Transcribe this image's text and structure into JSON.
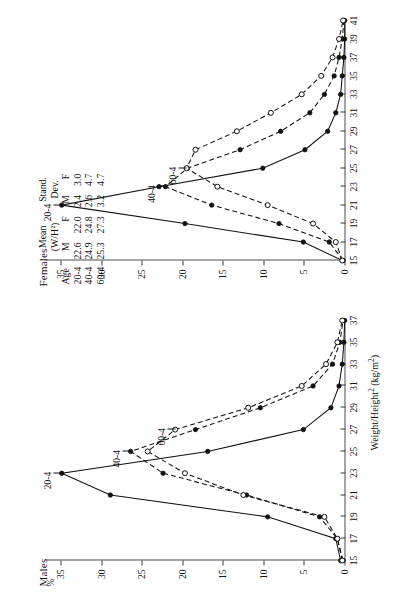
{
  "figure": {
    "panels": [
      {
        "id": "males",
        "title": "Males"
      },
      {
        "id": "females",
        "title": "Females"
      }
    ],
    "y_axis_unit": "%",
    "x_axis_title_html": "Weight/Height<sup>2</sup> (kg/m<sup>2</sup>)",
    "x_axis_title": "Weight/Height2 (kg/m2)"
  },
  "stats_table": {
    "group_headers": [
      "Mean (W/H²)",
      "Stand. Dev."
    ],
    "mean_header_line1": "Mean",
    "mean_header_line2": "(W/H²)",
    "sd_header_line1": "Stand.",
    "sd_header_line2": "Dev.",
    "columns": [
      "Age",
      "M",
      "F",
      "M",
      "F"
    ],
    "rows": [
      {
        "age": "20-4",
        "mean_m": "22.6",
        "mean_f": "22.0",
        "sd_m": "2.4",
        "sd_f": "3.0"
      },
      {
        "age": "40-4",
        "mean_m": "24.9",
        "mean_f": "24.8",
        "sd_m": "2.6",
        "sd_f": "4.7"
      },
      {
        "age": "60-4",
        "mean_m": "25.3",
        "mean_f": "27.3",
        "sd_m": "3.2",
        "sd_f": "4.7"
      }
    ]
  },
  "chart_data": {
    "type": "line",
    "title": "",
    "xlabel": "Weight/Height2 (kg/m2)",
    "ylabel": "%",
    "ylim": [
      0,
      37
    ],
    "y_ticks": [
      0,
      5,
      10,
      15,
      20,
      25,
      30,
      35
    ],
    "grid": false,
    "legend": "inline curve labels",
    "charts": [
      {
        "panel": "Males",
        "xlim": [
          15,
          37
        ],
        "x_ticks": [
          15,
          17,
          19,
          21,
          23,
          25,
          27,
          29,
          31,
          33,
          35,
          37
        ],
        "series": [
          {
            "name": "20-4",
            "marker": "filled",
            "line": "solid",
            "x": [
              15,
              17,
              19,
              21,
              23,
              25,
              27,
              29,
              31,
              33,
              35,
              37
            ],
            "values": [
              0.6,
              1.2,
              9.6,
              29.0,
              35.0,
              17.0,
              5.2,
              1.8,
              0.8,
              0.4,
              0.2,
              0.1
            ]
          },
          {
            "name": "40-4",
            "marker": "filled",
            "line": "dashed",
            "x": [
              15,
              17,
              19,
              21,
              23,
              25,
              27,
              29,
              31,
              33,
              35,
              37
            ],
            "values": [
              0.3,
              1.0,
              3.2,
              12.2,
              22.5,
              26.5,
              18.5,
              10.5,
              4.0,
              1.6,
              0.7,
              0.3
            ]
          },
          {
            "name": "60-4",
            "marker": "open",
            "line": "dashed",
            "x": [
              15,
              17,
              19,
              21,
              23,
              25,
              27,
              29,
              31,
              33,
              35,
              37
            ],
            "values": [
              0.4,
              1.0,
              2.6,
              12.6,
              19.8,
              24.4,
              21.0,
              12.0,
              5.4,
              2.4,
              1.0,
              0.4
            ]
          }
        ],
        "annotations": [
          {
            "text": "20-4",
            "at_x": 23,
            "at_y": 35.0
          },
          {
            "text": "40-4",
            "at_x": 25,
            "at_y": 26.5
          },
          {
            "text": "60-4",
            "at_x": 27,
            "at_y": 21.0
          }
        ]
      },
      {
        "panel": "Females",
        "xlim": [
          15,
          41
        ],
        "x_ticks": [
          15,
          17,
          19,
          21,
          23,
          25,
          27,
          29,
          31,
          33,
          35,
          37,
          39,
          41
        ],
        "series": [
          {
            "name": "20-4",
            "marker": "filled",
            "line": "solid",
            "x": [
              15,
              17,
              19,
              21,
              23,
              25,
              27,
              29,
              31,
              33,
              35,
              37,
              39,
              41
            ],
            "values": [
              0.4,
              5.2,
              19.8,
              35.0,
              23.0,
              10.2,
              5.0,
              2.2,
              1.2,
              0.6,
              0.4,
              0.2,
              0.1,
              0.1
            ]
          },
          {
            "name": "40-4",
            "marker": "filled",
            "line": "dashed",
            "x": [
              15,
              17,
              19,
              21,
              23,
              25,
              27,
              29,
              31,
              33,
              35,
              37,
              39,
              41
            ],
            "values": [
              0.3,
              2.0,
              8.2,
              16.5,
              22.2,
              19.5,
              13.0,
              8.0,
              4.4,
              2.6,
              1.4,
              0.8,
              0.4,
              0.2
            ]
          },
          {
            "name": "60-4",
            "marker": "open",
            "line": "dashed",
            "x": [
              15,
              17,
              19,
              21,
              23,
              25,
              27,
              29,
              31,
              33,
              35,
              37,
              39,
              41
            ],
            "values": [
              0.4,
              1.2,
              4.0,
              9.6,
              15.8,
              19.6,
              18.5,
              13.4,
              9.2,
              5.4,
              3.0,
              1.6,
              0.8,
              0.3
            ]
          }
        ],
        "annotations": [
          {
            "text": "20-4",
            "at_x": 21,
            "at_y": 35.0
          },
          {
            "text": "40-4",
            "at_x": 23,
            "at_y": 22.2
          },
          {
            "text": "60-4",
            "at_x": 25,
            "at_y": 19.6
          }
        ]
      }
    ]
  }
}
